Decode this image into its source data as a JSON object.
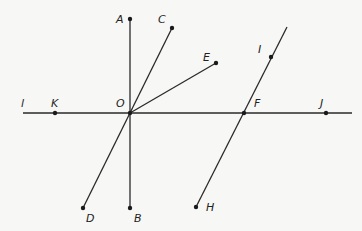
{
  "diagram": {
    "type": "geometry",
    "colors": {
      "background": "#f7f7f5",
      "ink": "#2a2a2a"
    },
    "lines": [
      {
        "name": "line-l",
        "x1": 23,
        "y1": 113,
        "x2": 352,
        "y2": 113,
        "label": "l",
        "label_x": 21,
        "label_y": 107
      },
      {
        "name": "segment-AB",
        "x1": 130,
        "y1": 19,
        "x2": 130,
        "y2": 208
      },
      {
        "name": "segment-CD",
        "x1": 172,
        "y1": 28,
        "x2": 83,
        "y2": 208
      },
      {
        "name": "segment-OE",
        "x1": 130,
        "y1": 113,
        "x2": 216,
        "y2": 63
      },
      {
        "name": "segment-HI",
        "x1": 196,
        "y1": 207,
        "x2": 287,
        "y2": 27
      }
    ],
    "points": [
      {
        "label": "A",
        "x": 130,
        "y": 19,
        "dot": true,
        "lx": 116,
        "ly": 23
      },
      {
        "label": "C",
        "x": 172,
        "y": 28,
        "dot": true,
        "lx": 158,
        "ly": 23
      },
      {
        "label": "E",
        "x": 216,
        "y": 63,
        "dot": true,
        "lx": 203,
        "ly": 61
      },
      {
        "label": "I",
        "x": 271,
        "y": 57,
        "dot": true,
        "lx": 258,
        "ly": 53
      },
      {
        "label": "K",
        "x": 55,
        "y": 113,
        "dot": true,
        "lx": 51,
        "ly": 107
      },
      {
        "label": "O",
        "x": 130,
        "y": 113,
        "dot": true,
        "lx": 116,
        "ly": 107
      },
      {
        "label": "F",
        "x": 244,
        "y": 113,
        "dot": true,
        "lx": 254,
        "ly": 107
      },
      {
        "label": "J",
        "x": 326,
        "y": 113,
        "dot": true,
        "lx": 320,
        "ly": 107
      },
      {
        "label": "D",
        "x": 83,
        "y": 208,
        "dot": true,
        "lx": 86,
        "ly": 222
      },
      {
        "label": "B",
        "x": 130,
        "y": 208,
        "dot": true,
        "lx": 134,
        "ly": 222
      },
      {
        "label": "H",
        "x": 196,
        "y": 207,
        "dot": true,
        "lx": 206,
        "ly": 211
      }
    ]
  }
}
